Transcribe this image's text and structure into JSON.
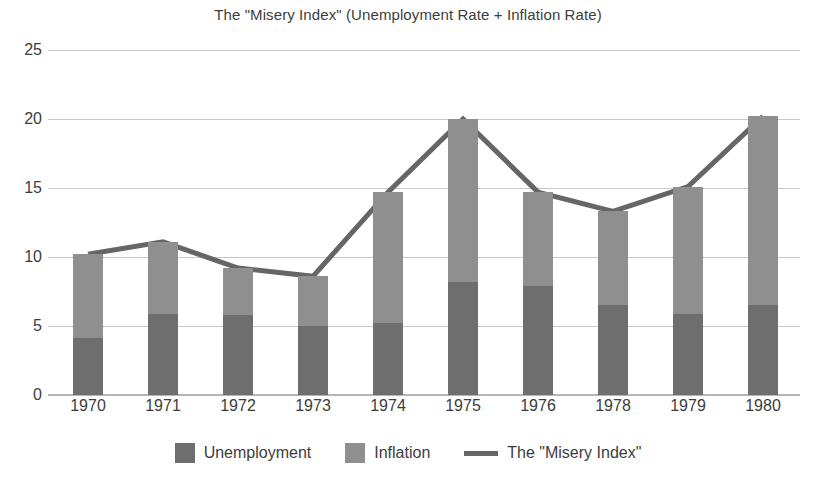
{
  "chart_data": {
    "type": "bar",
    "title": "The \"Misery Index\" (Unemployment Rate + Inflation Rate)",
    "xlabel": "",
    "ylabel": "",
    "ylim": [
      0,
      25
    ],
    "yticks": [
      0,
      5,
      10,
      15,
      20,
      25
    ],
    "grid": true,
    "stacked": true,
    "legend_position": "bottom",
    "categories": [
      "1970",
      "1971",
      "1972",
      "1973",
      "1974",
      "1975",
      "1976",
      "1978",
      "1979",
      "1980"
    ],
    "series": [
      {
        "name": "Unemployment",
        "type": "bar",
        "color": "#6e6e6e",
        "values": [
          4.1,
          5.9,
          5.8,
          5.0,
          5.2,
          8.2,
          7.9,
          6.5,
          5.9,
          6.5
        ]
      },
      {
        "name": "Inflation",
        "type": "bar",
        "color": "#8f8f8f",
        "values": [
          6.1,
          5.2,
          3.4,
          3.6,
          9.5,
          11.8,
          6.8,
          6.8,
          9.2,
          13.7
        ]
      },
      {
        "name": "The \"Misery Index\"",
        "type": "line",
        "color": "#666666",
        "values": [
          10.2,
          11.1,
          9.2,
          8.6,
          14.7,
          20.0,
          14.7,
          13.3,
          15.1,
          20.2
        ]
      }
    ]
  },
  "legend": {
    "items": [
      {
        "label": "Unemployment",
        "marker": "swatch",
        "color": "#6e6e6e"
      },
      {
        "label": "Inflation",
        "marker": "swatch",
        "color": "#8f8f8f"
      },
      {
        "label": "The \"Misery Index\"",
        "marker": "line",
        "color": "#666666"
      }
    ]
  },
  "colors": {
    "background": "#ffffff",
    "grid": "#c8c8c8",
    "axis": "#b5b5b5",
    "text": "#3d3d3d",
    "unemployment": "#6e6e6e",
    "inflation": "#8f8f8f",
    "misery_line": "#666666"
  }
}
